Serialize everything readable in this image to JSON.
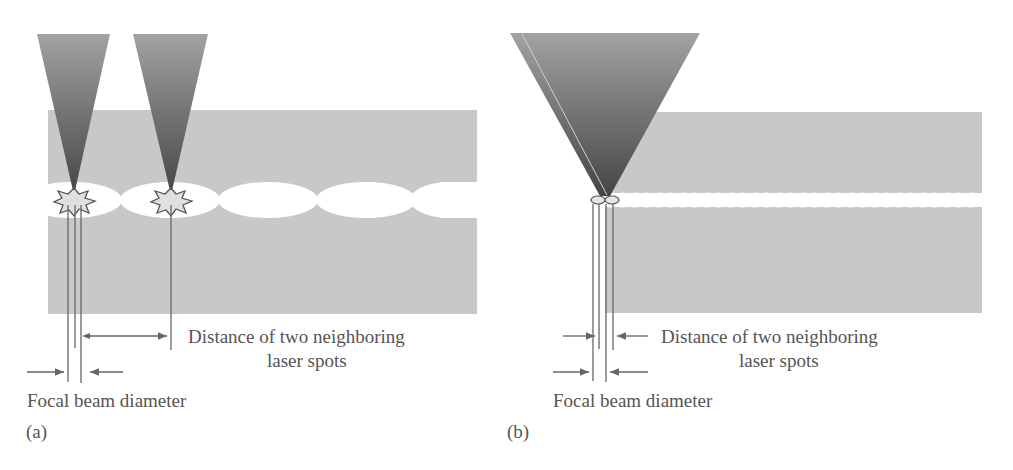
{
  "figure": {
    "panels": [
      {
        "id": "a",
        "caption": "(a)",
        "label_distance_line1": "Distance of two neighboring",
        "label_distance_line2": "laser spots",
        "label_focal": "Focal beam diameter",
        "description": "Low repetition / wide spacing: separated elliptical laser spots with two focused beams"
      },
      {
        "id": "b",
        "caption": "(b)",
        "label_distance_line1": "Distance of two neighboring",
        "label_distance_line2": "laser spots",
        "label_focal": "Focal beam diameter",
        "description": "High repetition / overlapping spots: continuous channel with one wide focusing cone"
      }
    ],
    "colors": {
      "material": "#c8c8c8",
      "channel": "#ffffff",
      "beam_top": "#9a9a9a",
      "beam_bottom": "#4a4a4a",
      "lines": "#666666",
      "text": "#555555"
    }
  }
}
